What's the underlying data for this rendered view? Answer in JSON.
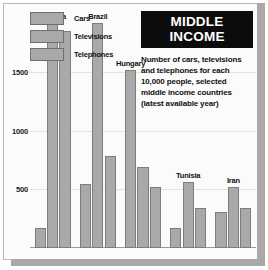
{
  "title": {
    "banner": "MIDDLE INCOME",
    "subtitle_lines": [
      "Number of cars, televisions",
      "and telephones for each",
      "10,000 people, selected",
      "middle income countries",
      "(latest available year)"
    ]
  },
  "legend": {
    "position": "top-left",
    "items": [
      {
        "label": "Cars",
        "color": "#a9a9a9"
      },
      {
        "label": "Televisions",
        "color": "#a9a9a9"
      },
      {
        "label": "Telephones",
        "color": "#a9a9a9"
      }
    ]
  },
  "axis": {
    "ticks": [
      "1500",
      "1000",
      "500"
    ]
  },
  "chart_data": {
    "type": "bar",
    "title": "MIDDLE INCOME",
    "subtitle": "Number of cars, televisions and telephones for each 10,000 people, selected middle income countries (latest available year)",
    "xlabel": "",
    "ylabel": "",
    "ylim": [
      0,
      2050
    ],
    "yticks": [
      500,
      1000,
      1500
    ],
    "grid": true,
    "legend_position": "top-left",
    "categories": [
      "S.Korea",
      "Brazil",
      "Hungary",
      "Tunisia",
      "Iran"
    ],
    "series": [
      {
        "name": "Cars",
        "values": [
          170,
          550,
          1520,
          170,
          310
        ]
      },
      {
        "name": "Televisions",
        "values": [
          1920,
          1920,
          690,
          560,
          520
        ]
      },
      {
        "name": "Telephones",
        "values": [
          1850,
          790,
          520,
          345,
          345
        ]
      }
    ]
  }
}
